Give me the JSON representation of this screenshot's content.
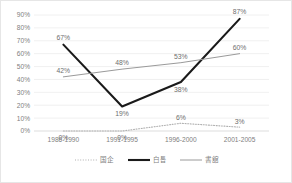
{
  "chart_data": {
    "type": "line",
    "title": "",
    "xlabel": "",
    "ylabel": "",
    "ylim": [
      0,
      0.9
    ],
    "grid": true,
    "legend_position": "bottom",
    "categories": [
      "1986-1990",
      "1991-1995",
      "1996-2000",
      "2001-2005"
    ],
    "ytick_labels": [
      "0%",
      "10%",
      "20%",
      "30%",
      "40%",
      "50%",
      "60%",
      "70%",
      "80%",
      "90%"
    ],
    "ytick_values": [
      0,
      10,
      20,
      30,
      40,
      50,
      60,
      70,
      80,
      90
    ],
    "series": [
      {
        "name": "国企",
        "style": "dotted",
        "color": "#b0b0b0",
        "values": [
          0,
          0,
          6,
          3
        ],
        "labels": [
          "0%",
          "0%",
          "6%",
          "3%"
        ]
      },
      {
        "name": "白톱",
        "style": "solid-thick",
        "color": "#1a1a1a",
        "values": [
          67,
          19,
          38,
          87
        ],
        "labels": [
          "67%",
          "19%",
          "38%",
          "87%"
        ]
      },
      {
        "name": "書舘",
        "style": "solid-thin",
        "color": "#9a9a9a",
        "values": [
          42,
          48,
          53,
          60
        ],
        "labels": [
          "42%",
          "48%",
          "53%",
          "60%"
        ]
      }
    ]
  },
  "legend": {
    "items": [
      {
        "label": "国企",
        "swatch": "dotted-line-icon"
      },
      {
        "label": "白톱",
        "swatch": "thick-line-icon"
      },
      {
        "label": "書舘",
        "swatch": "thin-line-icon"
      }
    ]
  }
}
